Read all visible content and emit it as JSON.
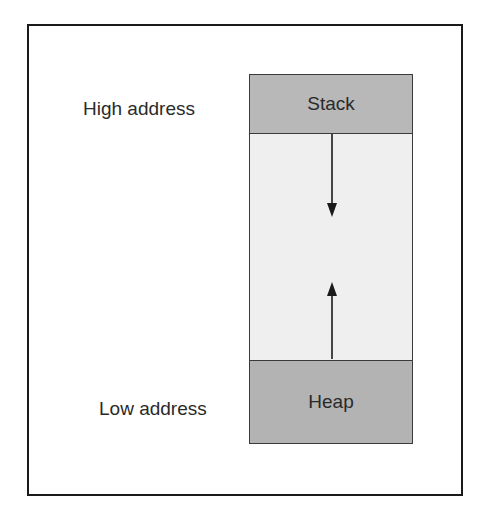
{
  "diagram": {
    "labels": {
      "high": "High address",
      "low": "Low address"
    },
    "segments": {
      "stack": "Stack",
      "heap": "Heap"
    },
    "arrows": [
      {
        "name": "stack-growth",
        "direction": "down",
        "from": "Stack",
        "meaning": "stack grows downward toward lower addresses"
      },
      {
        "name": "heap-growth",
        "direction": "up",
        "from": "Heap",
        "meaning": "heap grows upward toward higher addresses"
      }
    ],
    "colors": {
      "stack_fill": "#b8b8b8",
      "heap_fill": "#b3b3b3",
      "free_fill": "#efefef",
      "border": "#1a1a1a"
    }
  }
}
